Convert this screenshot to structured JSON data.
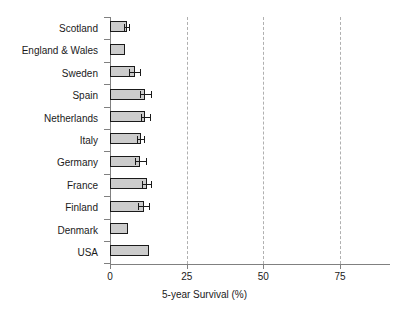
{
  "chart_data": {
    "type": "bar",
    "orientation": "horizontal",
    "title": "",
    "xlabel": "5-year Survival (%)",
    "ylabel": "",
    "xlim": [
      0,
      91
    ],
    "xticks": [
      0,
      25,
      50,
      75
    ],
    "xticklabels": [
      "0",
      "25",
      "50",
      "75"
    ],
    "grid": "vertical-dashed",
    "legend": "none",
    "categories": [
      "Scotland",
      "England & Wales",
      "Sweden",
      "Spain",
      "Netherlands",
      "Italy",
      "Germany",
      "France",
      "Finland",
      "Denmark",
      "USA"
    ],
    "values": [
      5.5,
      5.0,
      8.0,
      11.5,
      11.5,
      10.0,
      9.8,
      12.0,
      11.0,
      6.0,
      12.7
    ],
    "errors": [
      0.8,
      0.0,
      1.8,
      1.8,
      1.5,
      1.2,
      1.8,
      1.5,
      1.8,
      0.0,
      0.0
    ],
    "series": [
      {
        "name": "5-year Survival",
        "values": [
          5.5,
          5.0,
          8.0,
          11.5,
          11.5,
          10.0,
          9.8,
          12.0,
          11.0,
          6.0,
          12.7
        ]
      }
    ]
  },
  "style": {
    "bar_fill": "#cccccc",
    "bar_stroke": "#1a1a1a",
    "grid_color": "#b0b0b0",
    "axis_color": "#808080",
    "text_color": "#1a1a1a",
    "background": "#ffffff"
  }
}
